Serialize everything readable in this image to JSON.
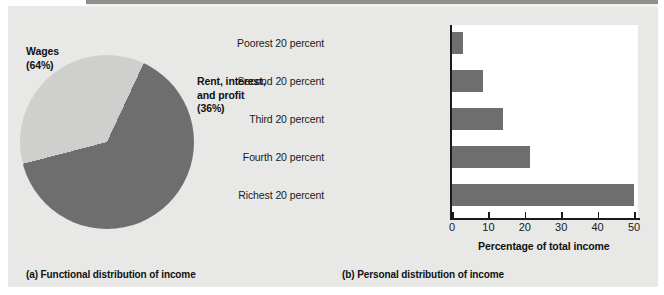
{
  "figure": {
    "background_color": "#e8e8e6",
    "panels": [
      {
        "caption": "(a) Functional distribution of income"
      },
      {
        "caption": "(b) Personal distribution of income"
      }
    ]
  },
  "panel_a": {
    "caption": "(a) Functional distribution of income",
    "labels": {
      "wages_name": "Wages",
      "wages_value": "(64%)",
      "rent_line1": "Rent, interest,",
      "rent_line2": "and profit",
      "rent_value": "(36%)"
    }
  },
  "panel_b": {
    "caption": "(b) Personal distribution of income",
    "axis_title": "Percentage of total income"
  },
  "chart_data": [
    {
      "type": "pie",
      "title": "(a) Functional distribution of income",
      "labels": [
        "Wages",
        "Rent, interest, and profit"
      ],
      "values": [
        64,
        36
      ],
      "value_labels": [
        "(64%)",
        "(36%)"
      ],
      "colors": [
        "#6e6e6e",
        "#cfcfcd"
      ],
      "legend": "inline-annotations",
      "units": "percent"
    },
    {
      "type": "bar",
      "orientation": "horizontal",
      "title": "(b) Personal distribution of income",
      "categories": [
        "Poorest 20 percent",
        "Second 20 percent",
        "Third 20 percent",
        "Fourth 20 percent",
        "Richest 20 percent"
      ],
      "values": [
        3,
        8.5,
        14,
        21.5,
        50
      ],
      "xlabel": "Percentage of total income",
      "ylabel": "",
      "xlim": [
        0,
        52
      ],
      "xticks": [
        0,
        10,
        20,
        30,
        40,
        50
      ],
      "xtick_labels": [
        "0",
        "10",
        "20",
        "30",
        "40",
        "50"
      ],
      "grid": false,
      "bar_color": "#6e6e6e",
      "plot_background": "#ffffff"
    }
  ]
}
